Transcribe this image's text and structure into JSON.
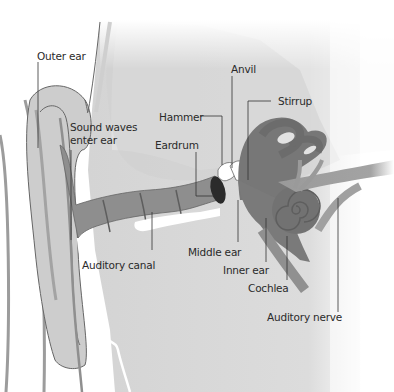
{
  "diagram": {
    "labels": {
      "outer_ear": "Outer ear",
      "sound_waves": "Sound waves",
      "enter_ear": "enter ear",
      "anvil": "Anvil",
      "stirrup": "Stirrup",
      "hammer": "Hammer",
      "eardrum": "Eardrum",
      "middle_ear": "Middle ear",
      "inner_ear": "Inner ear",
      "cochlea": "Cochlea",
      "auditory_canal": "Auditory canal",
      "auditory_nerve": "Auditory nerve"
    },
    "colors": {
      "background": "#ffffff",
      "head_fill": "#d6d6d6",
      "ear_fill": "#c9c9c9",
      "canal_fill": "#8e8e8e",
      "inner_ear_fill": "#777777",
      "nerve_fill": "#9a9a9a",
      "eardrum_fill": "#2b2b2b",
      "outline": "#555555",
      "label_text": "#2a2a2a"
    }
  }
}
